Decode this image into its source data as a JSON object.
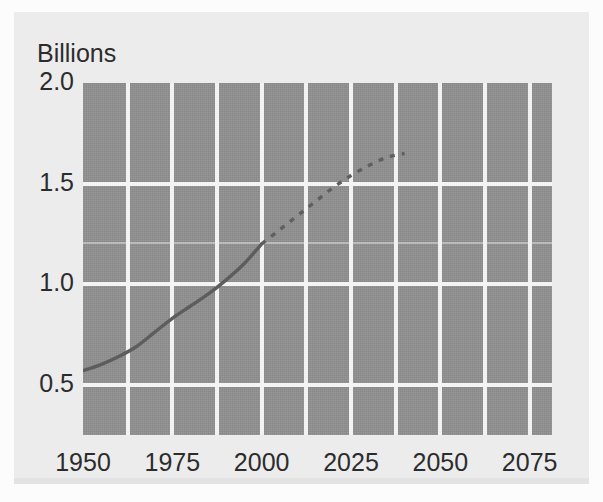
{
  "chart_data": {
    "type": "line",
    "title": "",
    "subtitle": "",
    "ylabel": "Billions",
    "xlabel": "",
    "xlim": [
      1950,
      2081.25
    ],
    "ylim": [
      0.25,
      2.0
    ],
    "grid": true,
    "legend": "none",
    "y_tick_labels": [
      "2.0",
      "1.5",
      "1.0",
      "0.5"
    ],
    "y_tick_values": [
      2.0,
      1.5,
      1.0,
      0.5
    ],
    "x_tick_labels": [
      "1950",
      "1975",
      "2000",
      "2025",
      "2050",
      "2075"
    ],
    "x_tick_values": [
      1950,
      1975,
      2000,
      2025,
      2050,
      2075
    ],
    "x_gridlines": [
      1962.5,
      1975,
      1987.5,
      2000,
      2012.5,
      2025,
      2037.5,
      2050,
      2062.5,
      2075
    ],
    "y_gridlines": [
      1.5,
      1.2,
      1.0,
      0.5
    ],
    "series": [
      {
        "name": "historical",
        "style": "solid",
        "color": "#5d5d5d",
        "x": [
          1950,
          1955,
          1960,
          1965,
          1970,
          1975,
          1980,
          1985,
          1990,
          1995,
          2000
        ],
        "values": [
          0.57,
          0.6,
          0.64,
          0.69,
          0.76,
          0.83,
          0.89,
          0.95,
          1.02,
          1.1,
          1.2
        ]
      },
      {
        "name": "projected",
        "style": "dashed",
        "color": "#5f5f5f",
        "x": [
          2000,
          2005,
          2010,
          2015,
          2020,
          2025,
          2030,
          2035,
          2040
        ],
        "values": [
          1.2,
          1.27,
          1.34,
          1.41,
          1.48,
          1.54,
          1.59,
          1.63,
          1.65
        ]
      }
    ]
  },
  "axis": {
    "unit_label": "Billions"
  },
  "colors": {
    "plot_background": "#8e8e8e",
    "gridline": "#f4f4f4",
    "card_background": "#ececed",
    "page_background": "#fcfcfc",
    "line": "#5d5d5d",
    "tick_text": "#2c2c2c"
  }
}
